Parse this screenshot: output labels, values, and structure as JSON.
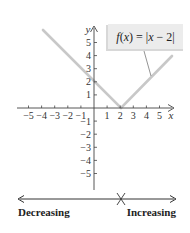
{
  "graph": {
    "function_label": "f(x) = |x − 2|",
    "function_label_parts": {
      "f": "f",
      "open": "(",
      "x": "x",
      "close": ")",
      "eq": " = |",
      "x2": "x",
      "rest": " − 2|"
    },
    "x_axis_label": "x",
    "y_axis_label": "y",
    "x_ticks": [
      {
        "value": -5,
        "label": "−5"
      },
      {
        "value": -4,
        "label": "−4"
      },
      {
        "value": -3,
        "label": "−3"
      },
      {
        "value": -2,
        "label": "−2"
      },
      {
        "value": -1,
        "label": "−1"
      },
      {
        "value": 1,
        "label": "1"
      },
      {
        "value": 2,
        "label": "2"
      },
      {
        "value": 3,
        "label": "3"
      },
      {
        "value": 4,
        "label": "4"
      },
      {
        "value": 5,
        "label": "5"
      }
    ],
    "y_ticks": [
      {
        "value": 5,
        "label": "5"
      },
      {
        "value": 4,
        "label": "4"
      },
      {
        "value": 3,
        "label": "3"
      },
      {
        "value": 2,
        "label": "2"
      },
      {
        "value": 1,
        "label": "1"
      },
      {
        "value": -1,
        "label": "−1"
      },
      {
        "value": -2,
        "label": "−2"
      },
      {
        "value": -3,
        "label": "−3"
      },
      {
        "value": -4,
        "label": "−4"
      },
      {
        "value": -5,
        "label": "−5"
      }
    ],
    "line_color": "#c8c8c8",
    "axis_color": "#444444",
    "label_box_color": "#ececec"
  },
  "number_line": {
    "left_label": "Decreasing",
    "right_label": "Increasing",
    "turning_point_x": 2
  }
}
